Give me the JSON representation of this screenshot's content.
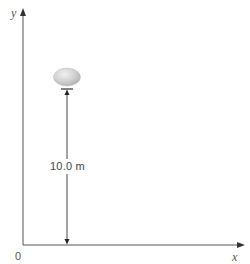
{
  "diagram": {
    "axes": {
      "y_label": "y",
      "x_label": "x",
      "origin_label": "0"
    },
    "object": {
      "name": "rock",
      "shape": "ellipse",
      "color": "#c8c8c8"
    },
    "dimension": {
      "label": "10.0 m",
      "value": 10.0,
      "unit": "m"
    },
    "colors": {
      "axis": "#555555",
      "text": "#444444",
      "object_fill": "#cfcfcf",
      "object_highlight": "#ececec"
    }
  }
}
